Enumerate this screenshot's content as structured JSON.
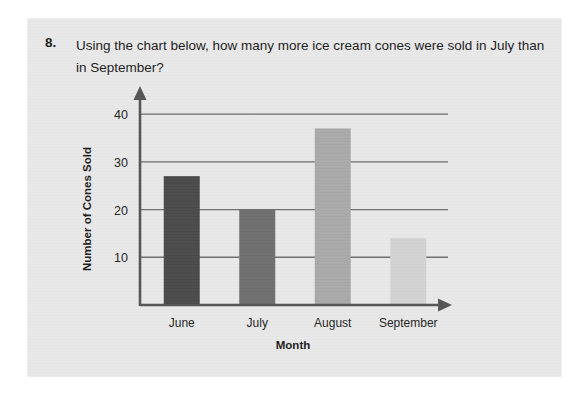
{
  "worksheet": {
    "question_number": "8.",
    "question_text": "Using the chart below, how many more ice cream cones were sold in July than in September?"
  },
  "chart_data": {
    "type": "bar",
    "title": "",
    "categories": [
      "June",
      "July",
      "August",
      "September"
    ],
    "values": [
      27,
      20,
      37,
      14
    ],
    "series": [
      {
        "name": "Number of Cones Sold",
        "values": [
          27,
          20,
          37,
          14
        ]
      }
    ],
    "xlabel": "Month",
    "ylabel": "Number of Cones Sold",
    "ylim": [
      0,
      44
    ],
    "yticks": [
      10,
      20,
      30,
      40
    ],
    "ytick_labels": [
      "10",
      "20",
      "30",
      "40"
    ],
    "grid": "horizontal",
    "legend": "none",
    "bar_colors": [
      "#4a4a4a",
      "#6f6f6f",
      "#a9a9a9",
      "#d2d2d2"
    ],
    "axis_color": "#555555",
    "gridline_color": "#6d6d6d",
    "plot_background": "#e3e3e3"
  }
}
